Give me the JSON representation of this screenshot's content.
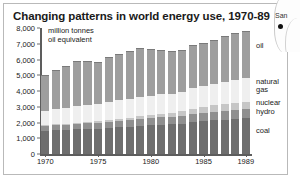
{
  "title": "Changing patterns in world energy use, 1970-89",
  "axis_unit_line1": "million tonnes",
  "axis_unit_line2": "oil equivalent",
  "map_fragment": {
    "city_label": "San",
    "dot_name": "city-marker"
  },
  "series_labels": {
    "oil": "oil",
    "natural_gas_line1": "natural",
    "natural_gas_line2": "gas",
    "nuclear": "nuclear",
    "hydro": "hydro",
    "coal": "coal"
  },
  "colors": {
    "oil": "#9e9e9e",
    "natural_gas": "#efefef",
    "nuclear": "#c6c6c6",
    "hydro": "#8f8f8f",
    "coal": "#6e6e6e",
    "axis": "#5d5d5d",
    "border": "#b9b9b9",
    "text": "#1a1a1a"
  },
  "chart_data": {
    "type": "bar",
    "subtype": "stacked-column",
    "title": "Changing patterns in world energy use, 1970-89",
    "xlabel": "",
    "ylabel": "million tonnes oil equivalent",
    "ylim": [
      0,
      8000
    ],
    "yticks": [
      0,
      1000,
      2000,
      3000,
      4000,
      5000,
      6000,
      7000,
      8000
    ],
    "ytick_labels": [
      "0",
      "1,000",
      "2,000",
      "3,000",
      "4,000",
      "5,000",
      "6,000",
      "7,000",
      "8,000"
    ],
    "grid": false,
    "legend_position": "right-inline",
    "categories": [
      "1970",
      "1971",
      "1972",
      "1973",
      "1974",
      "1975",
      "1976",
      "1977",
      "1978",
      "1979",
      "1980",
      "1981",
      "1982",
      "1983",
      "1984",
      "1985",
      "1986",
      "1987",
      "1988",
      "1989"
    ],
    "xtick_labels": [
      "1970",
      "1975",
      "1980",
      "1985",
      "1989"
    ],
    "stack_order_bottom_to_top": [
      "coal",
      "hydro",
      "nuclear",
      "natural gas",
      "oil"
    ],
    "series": [
      {
        "name": "coal",
        "color": "#6e6e6e",
        "values": [
          1480,
          1500,
          1520,
          1560,
          1580,
          1600,
          1650,
          1690,
          1710,
          1780,
          1820,
          1850,
          1880,
          1930,
          2010,
          2090,
          2130,
          2190,
          2250,
          2270
        ]
      },
      {
        "name": "hydro",
        "color": "#8f8f8f",
        "values": [
          330,
          345,
          360,
          370,
          385,
          395,
          405,
          420,
          435,
          450,
          460,
          470,
          480,
          495,
          510,
          520,
          535,
          545,
          560,
          570
        ]
      },
      {
        "name": "nuclear",
        "color": "#c6c6c6",
        "values": [
          20,
          30,
          45,
          60,
          75,
          95,
          115,
          140,
          165,
          180,
          200,
          240,
          265,
          300,
          360,
          400,
          420,
          440,
          460,
          470
        ]
      },
      {
        "name": "natural gas",
        "color": "#efefef",
        "values": [
          900,
          960,
          1010,
          1060,
          1080,
          1080,
          1130,
          1150,
          1180,
          1230,
          1230,
          1220,
          1210,
          1220,
          1290,
          1320,
          1340,
          1400,
          1460,
          1500
        ]
      },
      {
        "name": "oil",
        "color": "#9e9e9e",
        "values": [
          2270,
          2480,
          2650,
          2830,
          2790,
          2700,
          2880,
          2960,
          3050,
          3120,
          2980,
          2830,
          2720,
          2690,
          2730,
          2750,
          2840,
          2900,
          2970,
          3000
        ]
      }
    ],
    "totals": [
      5000,
      5315,
      5585,
      5880,
      5910,
      5870,
      6180,
      6360,
      6540,
      6760,
      6690,
      6610,
      6555,
      6635,
      6900,
      7080,
      7265,
      7475,
      7700,
      7810
    ]
  }
}
